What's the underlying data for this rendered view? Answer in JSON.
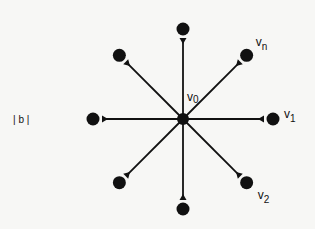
{
  "figure_label": "| b |",
  "center": {
    "label": "v",
    "sub": "0"
  },
  "spokes": [
    {
      "angle_deg": -90,
      "label": null
    },
    {
      "angle_deg": -45,
      "label": {
        "main": "v",
        "sub": "n"
      }
    },
    {
      "angle_deg": 0,
      "label": {
        "main": "v",
        "sub": "1"
      }
    },
    {
      "angle_deg": 45,
      "label": {
        "main": "v",
        "sub": "2"
      }
    },
    {
      "angle_deg": 90,
      "label": null
    },
    {
      "angle_deg": 135,
      "label": null
    },
    {
      "angle_deg": 180,
      "label": null
    },
    {
      "angle_deg": 225,
      "label": null
    }
  ],
  "arrow_direction": "inward",
  "colors": {
    "ink": "#111111",
    "background": "#f7f7f5"
  }
}
